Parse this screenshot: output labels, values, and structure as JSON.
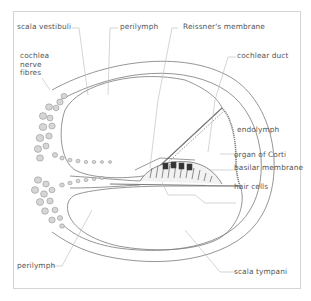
{
  "diagram": {
    "type": "anatomical cross-section",
    "subject": "cochlea",
    "colors": {
      "line": "#7a7a7a",
      "leader": "#b8b8b8",
      "nerve_fill": "#d6d6d6",
      "frame": "#d4d4d4",
      "text": "#555555"
    },
    "labels": {
      "scala_vestibuli": "scala vestibuli",
      "perilymph_top": "perilymph",
      "reissners_membrane": "Reissner's membrane",
      "cochlear_duct": "cochlear duct",
      "cochlea_nerve_fibres": "cochlea\nnerve\nfibres",
      "endolymph": "endolymph",
      "organ_of_corti": "organ of Corti",
      "basilar_membrane": "basilar membrane",
      "hair_cells": "hair cells",
      "perilymph_bottom": "perilymph",
      "scala_tympani": "scala tympani"
    }
  }
}
